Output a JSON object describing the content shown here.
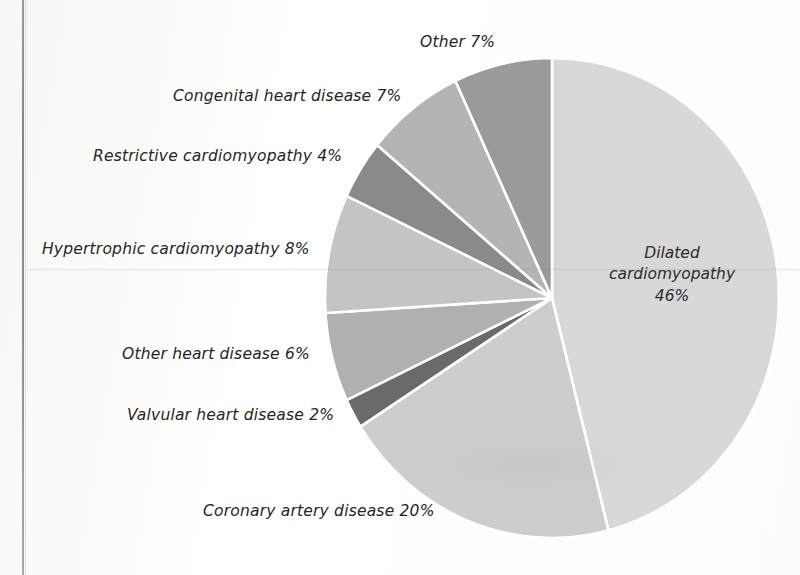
{
  "chart_data": {
    "type": "pie",
    "title": "",
    "units": "percent",
    "legend_position": "callout-labels",
    "start_angle_deg": 0,
    "direction": "clockwise",
    "categories": [
      "Dilated cardiomyopathy",
      "Coronary artery disease",
      "Valvular heart disease",
      "Other heart disease",
      "Hypertrophic cardiomyopathy",
      "Restrictive cardiomyopathy",
      "Congenital heart disease",
      "Other"
    ],
    "values": [
      46,
      20,
      2,
      6,
      8,
      4,
      7,
      7
    ],
    "colors": [
      "#d8d8d8",
      "#cdcdcd",
      "#6b6b6b",
      "#b0b0b0",
      "#c4c4c4",
      "#8a8a8a",
      "#b4b4b4",
      "#9a9a9a"
    ],
    "slice_border_color": "#ffffff",
    "slices": [
      {
        "label": "Dilated cardiomyopathy",
        "value": 46,
        "color": "#d8d8d8",
        "label_text": "Dilated\ncardiomyopathy\n46%",
        "label_placement": "inside"
      },
      {
        "label": "Coronary artery disease",
        "value": 20,
        "color": "#cdcdcd",
        "label_text": "Coronary artery disease 20%",
        "label_placement": "outside"
      },
      {
        "label": "Valvular heart disease",
        "value": 2,
        "color": "#6b6b6b",
        "label_text": "Valvular heart disease 2%",
        "label_placement": "outside"
      },
      {
        "label": "Other heart disease",
        "value": 6,
        "color": "#b0b0b0",
        "label_text": "Other heart disease 6%",
        "label_placement": "outside"
      },
      {
        "label": "Hypertrophic cardiomyopathy",
        "value": 8,
        "color": "#c4c4c4",
        "label_text": "Hypertrophic cardiomyopathy 8%",
        "label_placement": "outside"
      },
      {
        "label": "Restrictive cardiomyopathy",
        "value": 4,
        "color": "#8a8a8a",
        "label_text": "Restrictive cardiomyopathy 4%",
        "label_placement": "outside"
      },
      {
        "label": "Congenital heart disease",
        "value": 7,
        "color": "#b4b4b4",
        "label_text": "Congenital heart disease 7%",
        "label_placement": "outside"
      },
      {
        "label": "Other",
        "value": 7,
        "color": "#9a9a9a",
        "label_text": "Other 7%",
        "label_placement": "outside"
      }
    ]
  },
  "labels": {
    "other": "Other 7%",
    "congenital": "Congenital heart disease 7%",
    "restrictive": "Restrictive cardiomyopathy 4%",
    "hypertrophic": "Hypertrophic cardiomyopathy 8%",
    "other_heart": "Other heart disease 6%",
    "valvular": "Valvular heart disease 2%",
    "coronary": "Coronary artery disease 20%",
    "dilated_inner": "Dilated\ncardiomyopathy\n46%"
  },
  "geometry": {
    "center_x": 552,
    "center_y": 298,
    "radius_x": 227,
    "radius_y": 240
  },
  "palette": {
    "background": "#fefefe",
    "text": "#262626",
    "page_rule": "#7d7d7d",
    "separator": "#ffffff"
  }
}
